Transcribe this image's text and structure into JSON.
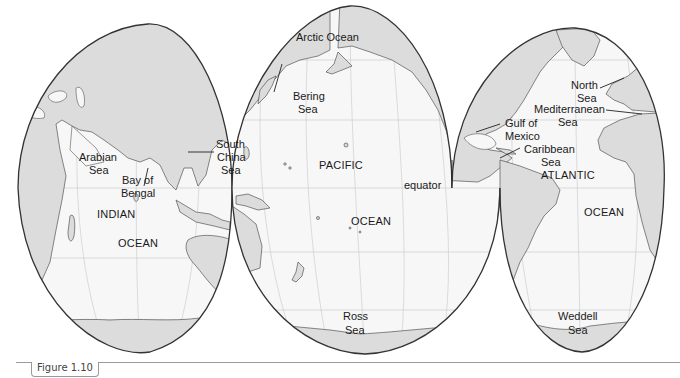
{
  "map": {
    "projection": "interrupted (Goode-style), ocean-centered",
    "colors": {
      "land": "#dcdcdc",
      "ocean": "#f7f7f7",
      "outline": "#333333",
      "graticule": "#c8c8c8"
    },
    "labels": {
      "arctic_ocean": "Arctic Ocean",
      "bering_sea_1": "Bering",
      "bering_sea_2": "Sea",
      "south_china_1": "South",
      "south_china_2": "China",
      "south_china_3": "Sea",
      "arabian_1": "Arabian",
      "arabian_2": "Sea",
      "bengal_1": "Bay of",
      "bengal_2": "Bengal",
      "indian": "INDIAN",
      "indian_ocean": "OCEAN",
      "pacific": "PACIFIC",
      "pacific_ocean": "OCEAN",
      "equator": "equator",
      "ross_1": "Ross",
      "ross_2": "Sea",
      "north_sea_1": "North",
      "north_sea_2": "Sea",
      "med_1": "Mediterranean",
      "med_2": "Sea",
      "gulf_1": "Gulf of",
      "gulf_2": "Mexico",
      "carib_1": "Caribbean",
      "carib_2": "Sea",
      "atlantic": "ATLANTIC",
      "atlantic_ocean": "OCEAN",
      "weddell_1": "Weddell",
      "weddell_2": "Sea"
    }
  },
  "caption": {
    "text": "Figure 1.10"
  }
}
